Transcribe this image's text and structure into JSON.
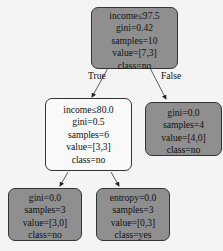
{
  "colors": {
    "dark": "#8f8f8f",
    "light": "#f9f9f9"
  },
  "edges": {
    "true_label": "True",
    "false_label": "False"
  },
  "nodes": {
    "root": {
      "lines": [
        "income≤97.5",
        "gini=0.42",
        "samples=10",
        "value=[7,3]",
        "class=no"
      ]
    },
    "left": {
      "lines": [
        "income≤80.0",
        "gini=0.5",
        "samples=6",
        "value=[3,3]",
        "class=no"
      ]
    },
    "right": {
      "lines": [
        "gini=0.0",
        "samples=4",
        "value=[4,0]",
        "class=no"
      ]
    },
    "left_left": {
      "lines": [
        "gini=0.0",
        "samples=3",
        "value=[3,0]",
        "class=no"
      ]
    },
    "left_right": {
      "lines": [
        "entropy=0.0",
        "samples=3",
        "value=[0,3]",
        "class=yes"
      ]
    }
  }
}
